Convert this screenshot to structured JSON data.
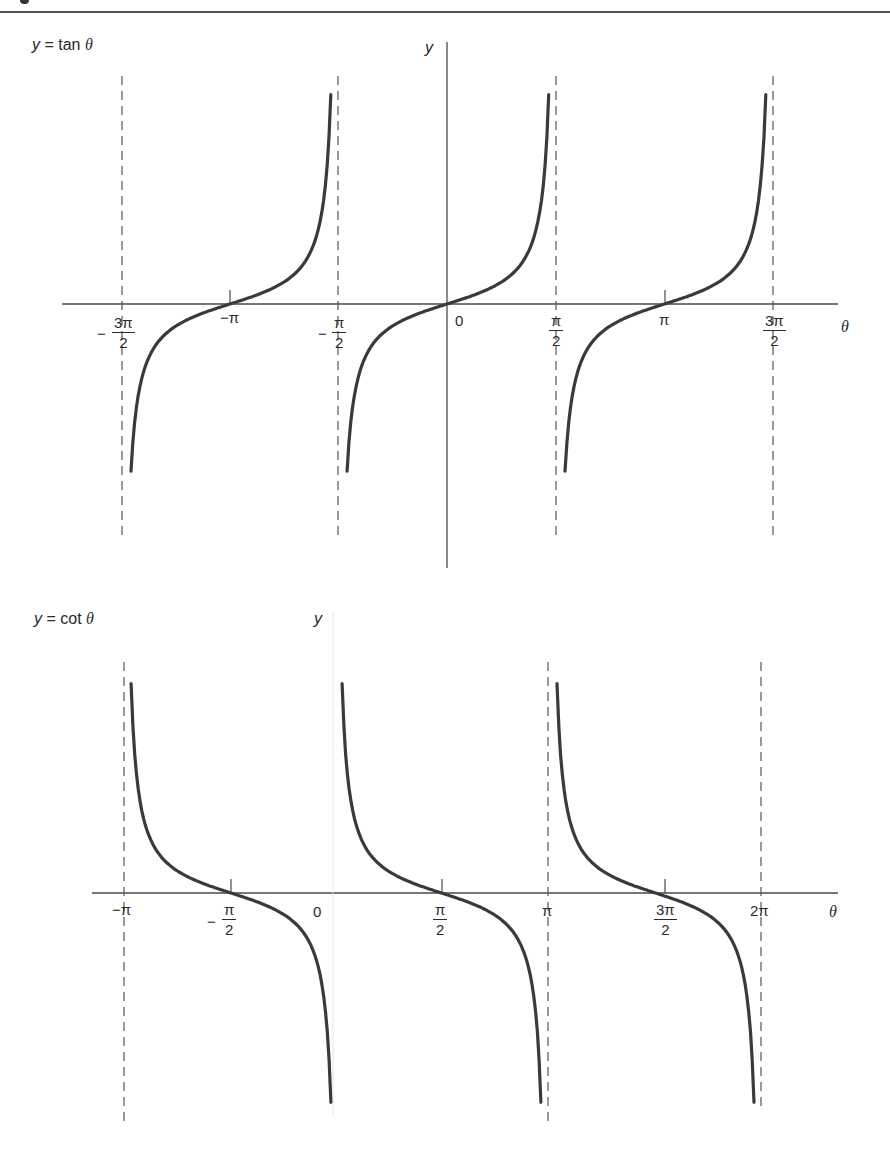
{
  "figure": {
    "top_rule": true,
    "colors": {
      "curve": "#3a3a3a",
      "axis": "#4a4a4a",
      "asymptote": "#555555",
      "faint_axis": "#e4e4e4"
    }
  },
  "chart_data": [
    {
      "type": "line",
      "title": "y = tan θ",
      "title_parts": {
        "y": "y",
        "eq": " = tan ",
        "theta": "θ"
      },
      "xlabel": "θ",
      "ylabel": "y",
      "function": "tan",
      "x_ticks": [
        {
          "id": "neg3pi2",
          "value": -4.712,
          "label_sign": "−",
          "label_num": "3π",
          "label_den": "2"
        },
        {
          "id": "negpi",
          "value": -3.1416,
          "label": "−π"
        },
        {
          "id": "negpi2",
          "value": -1.5708,
          "label_sign": "−",
          "label_num": "π",
          "label_den": "2"
        },
        {
          "id": "zero",
          "value": 0,
          "label": "0"
        },
        {
          "id": "pi2",
          "value": 1.5708,
          "label_num": "π",
          "label_den": "2"
        },
        {
          "id": "pi",
          "value": 3.1416,
          "label": "π"
        },
        {
          "id": "3pi2",
          "value": 4.712,
          "label_num": "3π",
          "label_den": "2"
        }
      ],
      "asymptotes": [
        "−3π/2",
        "−π/2",
        "π/2",
        "3π/2"
      ],
      "branches": [
        {
          "x_range": [
            "−3π/2",
            "−π/2"
          ],
          "zero_at": "−π"
        },
        {
          "x_range": [
            "−π/2",
            "π/2"
          ],
          "zero_at": "0"
        },
        {
          "x_range": [
            "π/2",
            "3π/2"
          ],
          "zero_at": "π"
        }
      ],
      "xlim": [
        -5.0,
        5.6
      ],
      "ylim": [
        -4,
        4
      ],
      "grid": false,
      "legend": "none"
    },
    {
      "type": "line",
      "title": "y = cot θ",
      "title_parts": {
        "y": "y",
        "eq": " = cot ",
        "theta": "θ"
      },
      "xlabel": "θ",
      "ylabel": "y",
      "function": "cot",
      "x_ticks": [
        {
          "id": "negpi",
          "value": -3.1416,
          "label": "−π"
        },
        {
          "id": "negpi2",
          "value": -1.5708,
          "label_sign": "−",
          "label_num": "π",
          "label_den": "2"
        },
        {
          "id": "zero",
          "value": 0,
          "label": "0"
        },
        {
          "id": "pi2",
          "value": 1.5708,
          "label_num": "π",
          "label_den": "2"
        },
        {
          "id": "pi",
          "value": 3.1416,
          "label": "π"
        },
        {
          "id": "3pi2",
          "value": 4.712,
          "label_num": "3π",
          "label_den": "2"
        },
        {
          "id": "2pi",
          "value": 6.2832,
          "label": "2π"
        }
      ],
      "asymptotes": [
        "−π",
        "π",
        "2π"
      ],
      "branches": [
        {
          "x_range": [
            "−π",
            "0"
          ],
          "zero_at": "−π/2"
        },
        {
          "x_range": [
            "0",
            "π"
          ],
          "zero_at": "π/2"
        },
        {
          "x_range": [
            "π",
            "2π"
          ],
          "zero_at": "3π/2"
        }
      ],
      "xlim": [
        -3.5,
        7.2
      ],
      "ylim": [
        -4,
        4
      ],
      "grid": false,
      "legend": "none"
    }
  ]
}
